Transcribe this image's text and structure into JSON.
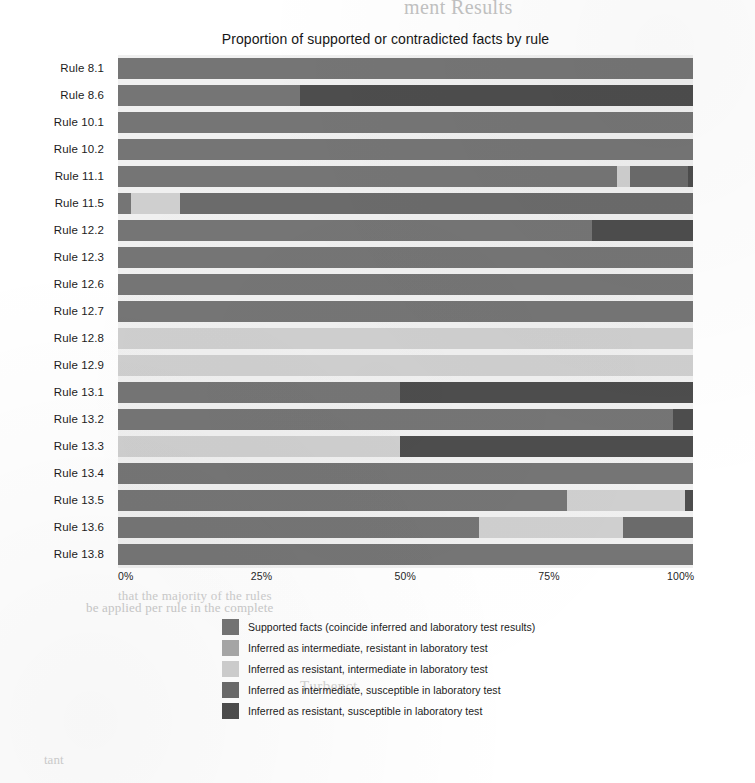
{
  "chart_data": {
    "type": "bar",
    "orientation": "horizontal",
    "stacked": true,
    "normalized": true,
    "title": "Proportion of supported or contradicted facts by rule",
    "xlabel": "",
    "ylabel": "",
    "xlim": [
      0,
      100
    ],
    "xticks": [
      "0%",
      "25%",
      "50%",
      "75%",
      "100%"
    ],
    "xtick_values": [
      0,
      25,
      50,
      75,
      100
    ],
    "grid": false,
    "legend_position": "bottom",
    "plot_background": "#f0f0f0",
    "categories": [
      "Rule  8.1",
      "Rule  8.6",
      "Rule 10.1",
      "Rule 10.2",
      "Rule 11.1",
      "Rule 11.5",
      "Rule 12.2",
      "Rule 12.3",
      "Rule 12.6",
      "Rule 12.7",
      "Rule 12.8",
      "Rule 12.9",
      "Rule 13.1",
      "Rule 13.2",
      "Rule 13.3",
      "Rule 13.4",
      "Rule 13.5",
      "Rule 13.6",
      "Rule 13.8"
    ],
    "series": [
      {
        "name": "Supported facts (coincide inferred and laboratory test results)",
        "color": "#757575",
        "values": [
          100,
          31.7,
          100,
          100,
          86.8,
          2.3,
          82.4,
          100,
          100,
          100,
          0,
          0,
          49,
          96.5,
          0,
          100,
          78.1,
          62.8,
          100
        ]
      },
      {
        "name": "Inferred as intermediate, resistant in laboratory test",
        "color": "#a8a8a8",
        "values": [
          0,
          0,
          0,
          0,
          0,
          0,
          0,
          0,
          0,
          0,
          0,
          0,
          0,
          0,
          0,
          0,
          0,
          0,
          0
        ]
      },
      {
        "name": "Inferred as resistant, intermediate in laboratory test",
        "color": "#cfcfcf",
        "values": [
          0,
          0,
          0,
          0,
          2.3,
          8.5,
          0,
          0,
          0,
          0,
          100,
          100,
          0,
          0,
          49,
          0,
          20.5,
          25,
          0
        ]
      },
      {
        "name": "Inferred as intermediate, susceptible in laboratory test",
        "color": "#6b6b6b",
        "values": [
          0,
          0,
          0,
          0,
          10.1,
          89.2,
          0,
          0,
          0,
          0,
          0,
          0,
          0,
          0,
          0,
          0,
          0,
          12.2,
          0
        ]
      },
      {
        "name": "Inferred as resistant, susceptible in laboratory test",
        "color": "#4d4d4d",
        "values": [
          0,
          68.3,
          0,
          0,
          0.8,
          0,
          17.6,
          0,
          0,
          0,
          0,
          0,
          51,
          3.5,
          51,
          0,
          1.4,
          0,
          0
        ]
      }
    ],
    "rows": [
      {
        "label": "Rule  8.1",
        "segments": [
          {
            "series": 0,
            "value": 100
          }
        ]
      },
      {
        "label": "Rule  8.6",
        "segments": [
          {
            "series": 0,
            "value": 31.7
          },
          {
            "series": 4,
            "value": 68.3
          }
        ]
      },
      {
        "label": "Rule 10.1",
        "segments": [
          {
            "series": 0,
            "value": 100
          }
        ]
      },
      {
        "label": "Rule 10.2",
        "segments": [
          {
            "series": 0,
            "value": 100
          }
        ]
      },
      {
        "label": "Rule 11.1",
        "segments": [
          {
            "series": 0,
            "value": 86.8
          },
          {
            "series": 2,
            "value": 2.3
          },
          {
            "series": 3,
            "value": 10.1
          },
          {
            "series": 4,
            "value": 0.8
          }
        ]
      },
      {
        "label": "Rule 11.5",
        "segments": [
          {
            "series": 0,
            "value": 2.3
          },
          {
            "series": 2,
            "value": 8.5
          },
          {
            "series": 3,
            "value": 89.2
          }
        ]
      },
      {
        "label": "Rule 12.2",
        "segments": [
          {
            "series": 0,
            "value": 82.4
          },
          {
            "series": 4,
            "value": 17.6
          }
        ]
      },
      {
        "label": "Rule 12.3",
        "segments": [
          {
            "series": 0,
            "value": 100
          }
        ]
      },
      {
        "label": "Rule 12.6",
        "segments": [
          {
            "series": 0,
            "value": 100
          }
        ]
      },
      {
        "label": "Rule 12.7",
        "segments": [
          {
            "series": 0,
            "value": 100
          }
        ]
      },
      {
        "label": "Rule 12.8",
        "segments": [
          {
            "series": 2,
            "value": 100
          }
        ]
      },
      {
        "label": "Rule 12.9",
        "segments": [
          {
            "series": 2,
            "value": 100
          }
        ]
      },
      {
        "label": "Rule 13.1",
        "segments": [
          {
            "series": 0,
            "value": 49
          },
          {
            "series": 4,
            "value": 51
          }
        ]
      },
      {
        "label": "Rule 13.2",
        "segments": [
          {
            "series": 0,
            "value": 96.5
          },
          {
            "series": 4,
            "value": 3.5
          }
        ]
      },
      {
        "label": "Rule 13.3",
        "segments": [
          {
            "series": 2,
            "value": 49
          },
          {
            "series": 4,
            "value": 51
          }
        ]
      },
      {
        "label": "Rule 13.4",
        "segments": [
          {
            "series": 0,
            "value": 100
          }
        ]
      },
      {
        "label": "Rule 13.5",
        "segments": [
          {
            "series": 0,
            "value": 78.1
          },
          {
            "series": 2,
            "value": 20.5
          },
          {
            "series": 4,
            "value": 1.4
          }
        ]
      },
      {
        "label": "Rule 13.6",
        "segments": [
          {
            "series": 0,
            "value": 62.8
          },
          {
            "series": 2,
            "value": 25
          },
          {
            "series": 3,
            "value": 12.2
          }
        ]
      },
      {
        "label": "Rule 13.8",
        "segments": [
          {
            "series": 0,
            "value": 100
          }
        ]
      }
    ]
  },
  "legend": {
    "items": [
      {
        "label": "Supported facts (coincide inferred and laboratory test results)",
        "color": "#757575"
      },
      {
        "label": "Inferred as intermediate, resistant in laboratory test",
        "color": "#a8a8a8"
      },
      {
        "label": "Inferred as resistant, intermediate in laboratory test",
        "color": "#cfcfcf"
      },
      {
        "label": "Inferred as intermediate, susceptible in laboratory test",
        "color": "#6b6b6b"
      },
      {
        "label": "Inferred as resistant, susceptible in laboratory test",
        "color": "#4d4d4d"
      }
    ]
  },
  "page_artifacts": {
    "header_bleed": "ment Results",
    "mid_bleed": "that the majority of the rules",
    "lower_bleed": "be applied per rule in the complete",
    "legend_bleed": "Turbenct",
    "bottom_bleed": "tant"
  }
}
